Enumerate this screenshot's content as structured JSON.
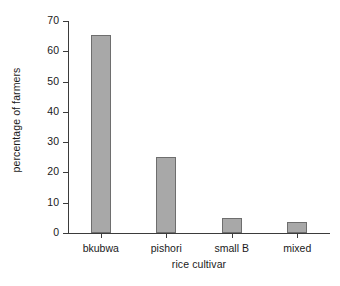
{
  "chart_data": {
    "type": "bar",
    "title": "",
    "subtitle": "",
    "categories": [
      "bkubwa",
      "pishori",
      "small B",
      "mixed"
    ],
    "values": [
      65.5,
      25,
      5,
      3.5
    ],
    "series": [
      {
        "name": "percentage of farmers",
        "values": [
          65.5,
          25,
          5,
          3.5
        ]
      }
    ],
    "xlabel": "rice cultivar",
    "ylabel": "percentage of farmers",
    "ylim": [
      0,
      70
    ],
    "ytick_labels": [
      "0",
      "10",
      "20",
      "30",
      "40",
      "50",
      "60",
      "70"
    ],
    "ytick_values": [
      0,
      10,
      20,
      30,
      40,
      50,
      60,
      70
    ],
    "grid": false,
    "legend": false,
    "legend_position": "none",
    "bar_fill_color": "#a8a8a8",
    "bar_border_color": "#6e6e6e",
    "axis_color": "#3b3b3b",
    "background_color": "#ffffff"
  }
}
